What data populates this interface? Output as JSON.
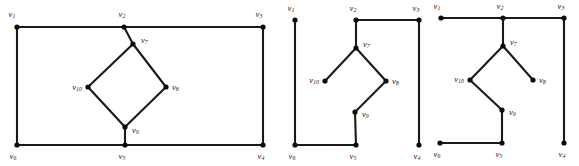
{
  "figure": {
    "name": "three-graph-diagram",
    "background_color": "#ffffff",
    "line_color": "#1a1a1a",
    "node_color": "#0d0d0d",
    "vertex_label_prefix": "v",
    "graphs": [
      {
        "id": "graph-1",
        "vertices": [
          {
            "id": "v1",
            "label": "v",
            "sub": "1",
            "x": 17,
            "y": 27,
            "lx": 12,
            "ly": 15,
            "anchor": "middle"
          },
          {
            "id": "v2",
            "label": "v",
            "sub": "2",
            "x": 124,
            "y": 27,
            "lx": 122,
            "ly": 15,
            "anchor": "middle"
          },
          {
            "id": "v3",
            "label": "v",
            "sub": "3",
            "x": 263,
            "y": 27,
            "lx": 259,
            "ly": 15,
            "anchor": "middle"
          },
          {
            "id": "v7",
            "label": "v",
            "sub": "7",
            "x": 133,
            "y": 44,
            "lx": 141,
            "ly": 41,
            "anchor": "start"
          },
          {
            "id": "v10",
            "label": "v",
            "sub": "10",
            "x": 88,
            "y": 87,
            "lx": 82,
            "ly": 88,
            "anchor": "end"
          },
          {
            "id": "v8",
            "label": "v",
            "sub": "8",
            "x": 166,
            "y": 87,
            "lx": 172,
            "ly": 88,
            "anchor": "start"
          },
          {
            "id": "v9",
            "label": "v",
            "sub": "9",
            "x": 125,
            "y": 127,
            "lx": 132,
            "ly": 131,
            "anchor": "start"
          },
          {
            "id": "v6",
            "label": "v",
            "sub": "6",
            "x": 17,
            "y": 145,
            "lx": 13,
            "ly": 157,
            "anchor": "middle"
          },
          {
            "id": "v5",
            "label": "v",
            "sub": "5",
            "x": 125,
            "y": 145,
            "lx": 122,
            "ly": 157,
            "anchor": "middle"
          },
          {
            "id": "v4",
            "label": "v",
            "sub": "4",
            "x": 263,
            "y": 145,
            "lx": 261,
            "ly": 157,
            "anchor": "middle"
          }
        ],
        "edges": [
          [
            "v1",
            "v2"
          ],
          [
            "v2",
            "v3"
          ],
          [
            "v1",
            "v6"
          ],
          [
            "v3",
            "v4"
          ],
          [
            "v6",
            "v5"
          ],
          [
            "v5",
            "v4"
          ],
          [
            "v2",
            "v7"
          ],
          [
            "v7",
            "v10"
          ],
          [
            "v7",
            "v8"
          ],
          [
            "v10",
            "v9"
          ],
          [
            "v8",
            "v9"
          ],
          [
            "v9",
            "v5"
          ]
        ]
      },
      {
        "id": "graph-2",
        "vertices": [
          {
            "id": "v1",
            "label": "v",
            "sub": "1",
            "x": 295,
            "y": 20,
            "lx": 291,
            "ly": 9,
            "anchor": "middle"
          },
          {
            "id": "v2",
            "label": "v",
            "sub": "2",
            "x": 356,
            "y": 20,
            "lx": 353,
            "ly": 9,
            "anchor": "middle"
          },
          {
            "id": "v3",
            "label": "v",
            "sub": "3",
            "x": 419,
            "y": 20,
            "lx": 416,
            "ly": 9,
            "anchor": "middle"
          },
          {
            "id": "v7",
            "label": "v",
            "sub": "7",
            "x": 356,
            "y": 48,
            "lx": 363,
            "ly": 45,
            "anchor": "start"
          },
          {
            "id": "v10",
            "label": "v",
            "sub": "10",
            "x": 325,
            "y": 81,
            "lx": 319,
            "ly": 81,
            "anchor": "end"
          },
          {
            "id": "v8",
            "label": "v",
            "sub": "8",
            "x": 386,
            "y": 81,
            "lx": 392,
            "ly": 82,
            "anchor": "start"
          },
          {
            "id": "v9",
            "label": "v",
            "sub": "9",
            "x": 355,
            "y": 112,
            "lx": 362,
            "ly": 115,
            "anchor": "start"
          },
          {
            "id": "v6",
            "label": "v",
            "sub": "6",
            "x": 295,
            "y": 145,
            "lx": 292,
            "ly": 157,
            "anchor": "middle"
          },
          {
            "id": "v5",
            "label": "v",
            "sub": "5",
            "x": 356,
            "y": 145,
            "lx": 353,
            "ly": 157,
            "anchor": "middle"
          },
          {
            "id": "v4",
            "label": "v",
            "sub": "4",
            "x": 419,
            "y": 145,
            "lx": 417,
            "ly": 157,
            "anchor": "middle"
          }
        ],
        "edges": [
          [
            "v2",
            "v3"
          ],
          [
            "v1",
            "v6"
          ],
          [
            "v3",
            "v4"
          ],
          [
            "v6",
            "v5"
          ],
          [
            "v2",
            "v7"
          ],
          [
            "v7",
            "v10"
          ],
          [
            "v7",
            "v8"
          ],
          [
            "v8",
            "v9"
          ],
          [
            "v9",
            "v5"
          ]
        ]
      },
      {
        "id": "graph-3",
        "vertices": [
          {
            "id": "v1",
            "label": "v",
            "sub": "1",
            "x": 441,
            "y": 18,
            "lx": 437,
            "ly": 7,
            "anchor": "middle"
          },
          {
            "id": "v2",
            "label": "v",
            "sub": "2",
            "x": 503,
            "y": 18,
            "lx": 500,
            "ly": 7,
            "anchor": "middle"
          },
          {
            "id": "v3",
            "label": "v",
            "sub": "3",
            "x": 564,
            "y": 18,
            "lx": 561,
            "ly": 7,
            "anchor": "middle"
          },
          {
            "id": "v7",
            "label": "v",
            "sub": "7",
            "x": 503,
            "y": 46,
            "lx": 510,
            "ly": 43,
            "anchor": "start"
          },
          {
            "id": "v10",
            "label": "v",
            "sub": "10",
            "x": 470,
            "y": 80,
            "lx": 464,
            "ly": 80,
            "anchor": "end"
          },
          {
            "id": "v8",
            "label": "v",
            "sub": "8",
            "x": 533,
            "y": 80,
            "lx": 539,
            "ly": 81,
            "anchor": "start"
          },
          {
            "id": "v9",
            "label": "v",
            "sub": "9",
            "x": 502,
            "y": 110,
            "lx": 509,
            "ly": 113,
            "anchor": "start"
          },
          {
            "id": "v6",
            "label": "v",
            "sub": "6",
            "x": 440,
            "y": 143,
            "lx": 437,
            "ly": 155,
            "anchor": "middle"
          },
          {
            "id": "v5",
            "label": "v",
            "sub": "5",
            "x": 502,
            "y": 143,
            "lx": 499,
            "ly": 155,
            "anchor": "middle"
          },
          {
            "id": "v4",
            "label": "v",
            "sub": "4",
            "x": 564,
            "y": 143,
            "lx": 562,
            "ly": 155,
            "anchor": "middle"
          }
        ],
        "edges": [
          [
            "v1",
            "v2"
          ],
          [
            "v2",
            "v3"
          ],
          [
            "v3",
            "v4"
          ],
          [
            "v6",
            "v5"
          ],
          [
            "v2",
            "v7"
          ],
          [
            "v7",
            "v10"
          ],
          [
            "v7",
            "v8"
          ],
          [
            "v10",
            "v9"
          ],
          [
            "v9",
            "v5"
          ]
        ]
      }
    ]
  }
}
